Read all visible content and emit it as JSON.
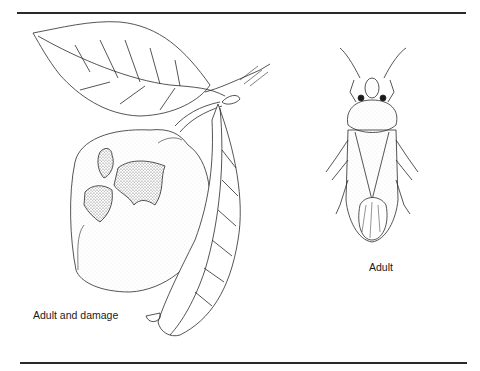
{
  "figure": {
    "captions": {
      "left": "Adult and damage",
      "right": "Adult"
    },
    "panels": [
      {
        "id": "fruit",
        "subject": "fruit-with-leaves-and-feeding-damage-icon"
      },
      {
        "id": "insect",
        "subject": "stink-bug-adult-icon"
      }
    ],
    "colors": {
      "ink": "#2a2a2a",
      "paper": "#ffffff",
      "stipple": "#9a9a9a"
    }
  }
}
